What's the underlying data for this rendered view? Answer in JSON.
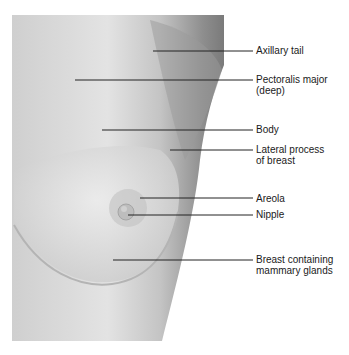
{
  "figure": {
    "labels": [
      {
        "id": "axillary-tail",
        "text": "Axillary tail",
        "y": 45,
        "line_y": 51,
        "line_x1": 153
      },
      {
        "id": "pectoralis-major",
        "text": "Pectoralis major\n(deep)",
        "y": 74,
        "line_y": 80,
        "line_x1": 75
      },
      {
        "id": "body",
        "text": "Body",
        "y": 124,
        "line_y": 130,
        "line_x1": 102
      },
      {
        "id": "lateral-process",
        "text": "Lateral process\nof breast",
        "y": 144,
        "line_y": 150,
        "line_x1": 170
      },
      {
        "id": "areola",
        "text": "Areola",
        "y": 193,
        "line_y": 198,
        "line_x1": 140
      },
      {
        "id": "nipple",
        "text": "Nipple",
        "y": 209,
        "line_y": 215,
        "line_x1": 128
      },
      {
        "id": "breast-mammary-glands",
        "text": "Breast containing\nmammary glands",
        "y": 254,
        "line_y": 260,
        "line_x1": 113
      }
    ]
  }
}
